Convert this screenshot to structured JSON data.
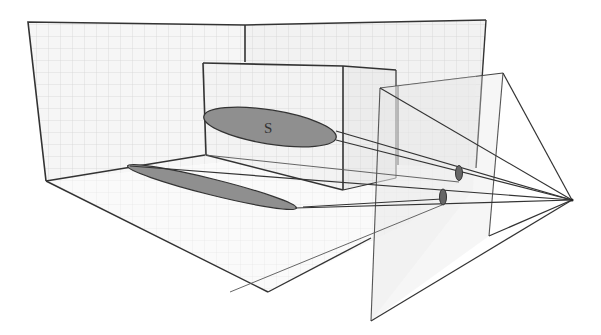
{
  "figure": {
    "labels": {
      "shape_label": "S"
    },
    "colors": {
      "line": "#333333",
      "grid": "#cfcfcf",
      "wall_fill": "#f4f4f4",
      "ellipse_fill": "#8f8f8f",
      "plane_fill": "#eeeeee",
      "background": "#ffffff"
    },
    "elements": [
      {
        "name": "left-wall",
        "type": "plane-with-grid"
      },
      {
        "name": "back-wall",
        "type": "plane-with-grid"
      },
      {
        "name": "floor",
        "type": "plane-with-grid"
      },
      {
        "name": "box",
        "type": "rectangular-prism"
      },
      {
        "name": "ellipse-s",
        "type": "ellipse",
        "label": "S"
      },
      {
        "name": "floor-shadow-ellipse",
        "type": "ellipse"
      },
      {
        "name": "projection-plane-front",
        "type": "quad"
      },
      {
        "name": "projection-plane-back",
        "type": "quad"
      },
      {
        "name": "image-ellipse-upper",
        "type": "small-ellipse"
      },
      {
        "name": "image-ellipse-lower",
        "type": "small-ellipse"
      },
      {
        "name": "focal-point",
        "type": "point"
      }
    ]
  }
}
